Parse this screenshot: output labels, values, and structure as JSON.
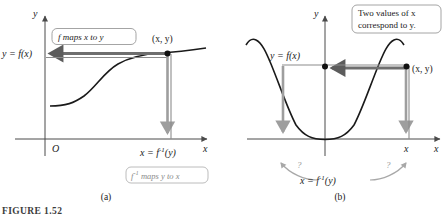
{
  "figure": {
    "caption": "FIGURE 1.52",
    "panels": [
      {
        "id": "a",
        "letter": "(a)",
        "origin_label": "O",
        "x_axis_label": "x",
        "y_axis_label": "y",
        "function_label": "y = f(x)",
        "point_label": "(x, y)",
        "inverse_label_prefix": "x = f",
        "inverse_label_exponent": "-1",
        "inverse_label_suffix": "(y)",
        "callout_top": {
          "parts": [
            "f",
            " maps ",
            "x",
            " to ",
            "y"
          ],
          "text": "f maps x to y"
        },
        "callout_bottom": {
          "prefix": "f",
          "exponent": "-1",
          "suffix": " maps y to x",
          "text": "f -1 maps y to x"
        },
        "curve_type": "increasing sigmoid (one-to-one)"
      },
      {
        "id": "b",
        "letter": "(b)",
        "x_axis_label": "x",
        "y_axis_label": "y",
        "function_label": "y = f(x)",
        "point_label": "(x, y)",
        "x_tick_label": "x",
        "inverse_label_prefix": "x = f",
        "inverse_label_exponent": "-1",
        "inverse_label_suffix": "(y)",
        "question_marks": [
          "?",
          "?"
        ],
        "callout_top": {
          "line1": "Two values of x",
          "line2": "correspond to y.",
          "text": "Two values of x correspond to y."
        },
        "curve_type": "cosine-like even curve (not one-to-one)"
      }
    ]
  },
  "colors": {
    "curve": "#1a1a1a",
    "axis": "#4a4a4a",
    "arrow_dark": "#6e6e6e",
    "arrow_light": "#9e9e9e",
    "callout_border": "#9a9a9a",
    "callout_border_gray": "#b4b4b4",
    "gray_text": "#8a8a8a",
    "background": "#ffffff"
  }
}
